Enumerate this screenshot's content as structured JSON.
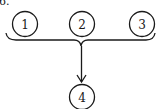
{
  "problem_label": "6.",
  "nodes": [
    {
      "id": "node-1",
      "label": "1",
      "cx": 25,
      "cy": 24
    },
    {
      "id": "node-2",
      "label": "2",
      "cx": 82,
      "cy": 24
    },
    {
      "id": "node-3",
      "label": "3",
      "cx": 142,
      "cy": 24
    },
    {
      "id": "node-4",
      "label": "4",
      "cx": 82,
      "cy": 97
    }
  ],
  "edges": [
    {
      "from": [
        "1",
        "2",
        "3"
      ],
      "to": "4",
      "type": "brace-merge-arrow"
    }
  ],
  "colors": {
    "stroke": "#1a1a1a",
    "background": "#ffffff"
  }
}
